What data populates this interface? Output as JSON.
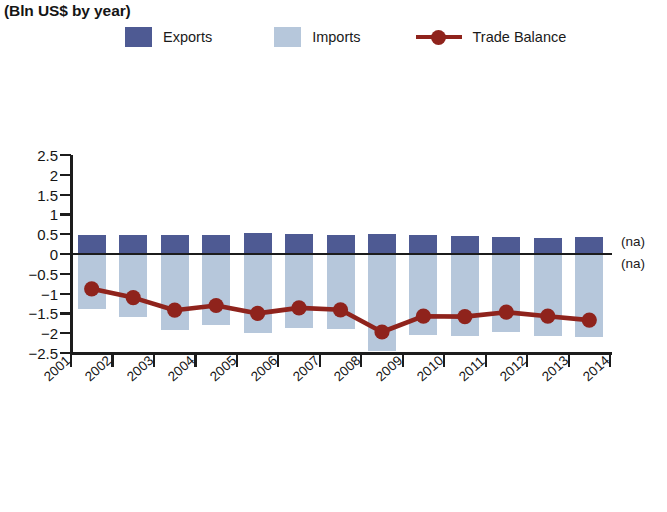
{
  "chart_data": {
    "type": "bar",
    "title": "",
    "subtitle": "(Bln US$ by year)",
    "xlabel": "",
    "ylabel": "",
    "ylim": [
      -2.5,
      2.5
    ],
    "xlim": [
      2001,
      2014
    ],
    "grid": false,
    "legend_position": "top",
    "categories": [
      "2001",
      "2002",
      "2003",
      "2004",
      "2005",
      "2006",
      "2007",
      "2008",
      "2009",
      "2010",
      "2011",
      "2012",
      "2013"
    ],
    "x_tick_labels": [
      "2001",
      "2002",
      "2003",
      "2004",
      "2005",
      "2006",
      "2007",
      "2008",
      "2009",
      "2010",
      "2011",
      "2012",
      "2013",
      "2014"
    ],
    "y_tick_labels": [
      "2.5",
      "2",
      "1.5",
      "1",
      "0.5",
      "0",
      "−0.5",
      "−1",
      "−1.5",
      "−2",
      "−2.5"
    ],
    "y_tick_values": [
      2.5,
      2,
      1.5,
      1,
      0.5,
      0,
      -0.5,
      -1,
      -1.5,
      -2,
      -2.5
    ],
    "annotations": [
      {
        "text": "(na)",
        "x": 2014,
        "y": 0.28,
        "name": "na-label-above-axis"
      },
      {
        "text": "(na)",
        "x": 2014,
        "y": -0.28,
        "name": "na-label-below-axis"
      }
    ],
    "series": [
      {
        "name": "Exports",
        "type": "bar",
        "color": "#4e5a93",
        "values": [
          0.49,
          0.49,
          0.47,
          0.49,
          0.53,
          0.5,
          0.48,
          0.51,
          0.47,
          0.46,
          0.43,
          0.41,
          0.42
        ]
      },
      {
        "name": "Imports",
        "type": "bar",
        "color": "#b6c7db",
        "values": [
          -1.38,
          -1.59,
          -1.91,
          -1.79,
          -1.99,
          -1.86,
          -1.9,
          -2.46,
          -2.05,
          -2.06,
          -1.96,
          -2.08,
          -2.09
        ]
      },
      {
        "name": "Trade Balance",
        "type": "line",
        "color": "#8f231c",
        "marker_color": "#8f231c",
        "values": [
          -0.88,
          -1.1,
          -1.42,
          -1.3,
          -1.5,
          -1.36,
          -1.41,
          -1.97,
          -1.57,
          -1.58,
          -1.47,
          -1.57,
          -1.67
        ]
      }
    ]
  },
  "legend": {
    "items": [
      {
        "label": "Exports",
        "color": "#4e5a93",
        "marker": "square"
      },
      {
        "label": "Imports",
        "color": "#b6c7db",
        "marker": "square"
      },
      {
        "label": "Trade Balance",
        "color": "#8f231c",
        "marker": "line-dot"
      }
    ]
  },
  "axes": {
    "axis_color": "#1c1c1c"
  }
}
